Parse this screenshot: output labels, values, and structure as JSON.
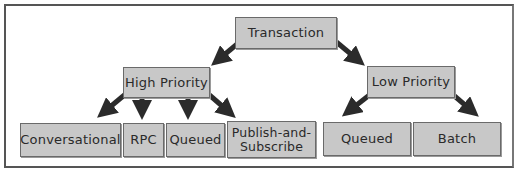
{
  "diagram": {
    "type": "hierarchy",
    "root": {
      "id": "transaction",
      "label": "Transaction"
    },
    "level1": [
      {
        "id": "high-priority",
        "label": "High Priority"
      },
      {
        "id": "low-priority",
        "label": "Low Priority"
      }
    ],
    "level2": [
      {
        "id": "conversational",
        "label": "Conversational",
        "parent": "high-priority"
      },
      {
        "id": "rpc",
        "label": "RPC",
        "parent": "high-priority"
      },
      {
        "id": "queued-high",
        "label": "Queued",
        "parent": "high-priority"
      },
      {
        "id": "publish-subscribe",
        "label_line1": "Publish-and-",
        "label_line2": "Subscribe",
        "parent": "high-priority"
      },
      {
        "id": "queued-low",
        "label": "Queued",
        "parent": "low-priority"
      },
      {
        "id": "batch",
        "label": "Batch",
        "parent": "low-priority"
      }
    ],
    "edges": [
      [
        "transaction",
        "high-priority"
      ],
      [
        "transaction",
        "low-priority"
      ],
      [
        "high-priority",
        "conversational"
      ],
      [
        "high-priority",
        "rpc"
      ],
      [
        "high-priority",
        "queued-high"
      ],
      [
        "high-priority",
        "publish-subscribe"
      ],
      [
        "low-priority",
        "queued-low"
      ],
      [
        "low-priority",
        "batch"
      ]
    ],
    "colors": {
      "box_fill": "#c8c8c8",
      "box_border": "#6a6a6a",
      "arrow": "#2b2b2b",
      "frame": "#555555"
    }
  }
}
